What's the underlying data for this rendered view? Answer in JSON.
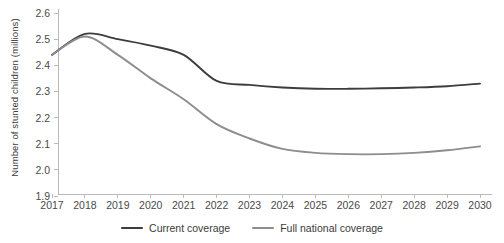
{
  "chart_data": {
    "type": "line",
    "title": "",
    "xlabel": "",
    "ylabel": "Number of stunted children (millions)",
    "categories": [
      "2017",
      "2018",
      "2019",
      "2020",
      "2021",
      "2022",
      "2023",
      "2024",
      "2025",
      "2026",
      "2027",
      "2028",
      "2029",
      "2030"
    ],
    "x": [
      2017,
      2018,
      2019,
      2020,
      2021,
      2022,
      2023,
      2024,
      2025,
      2026,
      2027,
      2028,
      2029,
      2030
    ],
    "ylim": [
      1.9,
      2.6
    ],
    "xlim": [
      2017,
      2030
    ],
    "yticks": [
      "1.9",
      "2.0",
      "2.1",
      "2.2",
      "2.3",
      "2.4",
      "2.5",
      "2.6"
    ],
    "ytick_values": [
      1.9,
      2.0,
      2.1,
      2.2,
      2.3,
      2.4,
      2.5,
      2.6
    ],
    "grid": false,
    "legend_position": "bottom-center",
    "series": [
      {
        "name": "Current coverage",
        "color": "#3d3d3d",
        "values": [
          2.44,
          2.52,
          2.5,
          2.475,
          2.44,
          2.34,
          2.325,
          2.315,
          2.31,
          2.31,
          2.312,
          2.315,
          2.32,
          2.33
        ]
      },
      {
        "name": "Full national coverage",
        "color": "#8d8d8d",
        "values": [
          2.44,
          2.51,
          2.44,
          2.35,
          2.27,
          2.175,
          2.12,
          2.08,
          2.065,
          2.06,
          2.06,
          2.065,
          2.075,
          2.09
        ]
      }
    ]
  }
}
